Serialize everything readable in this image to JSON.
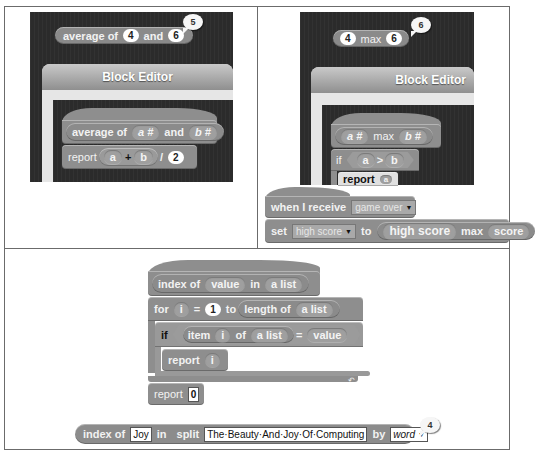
{
  "panels": {
    "top_left": {
      "result_block": {
        "label": "average of",
        "arg1": "4",
        "conj": "and",
        "arg2": "6",
        "result": "5"
      },
      "editor": {
        "title": "Block Editor",
        "prototype": {
          "label": "average of",
          "param1": "a #",
          "conj": "and",
          "param2": "b #"
        },
        "body": {
          "keyword": "report",
          "left": "a",
          "op": "+",
          "right": "b",
          "div": "/",
          "divisor": "2"
        }
      }
    },
    "top_right": {
      "result_block": {
        "arg1": "4",
        "op": "max",
        "arg2": "6",
        "result": "6"
      },
      "editor": {
        "title": "Block Editor",
        "prototype": {
          "param1": "a #",
          "op": "max",
          "param2": "b #"
        },
        "if_line": {
          "keyword": "if",
          "left": "a",
          "op": ">",
          "right": "b"
        },
        "report_line": {
          "keyword": "report",
          "arg": "a"
        }
      },
      "script": {
        "hat": {
          "label": "when I receive",
          "message": "game over"
        },
        "set": {
          "keyword": "set",
          "variable": "high score",
          "to": "to",
          "left": "high score",
          "op": "max",
          "right": "score"
        }
      }
    },
    "bottom": {
      "definition": {
        "prototype": {
          "label": "index of",
          "param1": "value",
          "in": "in",
          "param2": "a list"
        },
        "for": {
          "keyword": "for",
          "var": "i",
          "eq": "=",
          "start": "1",
          "to": "to",
          "length_label": "length of",
          "list": "a list"
        },
        "if": {
          "keyword": "if",
          "item_label": "item",
          "index": "i",
          "of": "of",
          "list": "a list",
          "eq": "=",
          "value": "value"
        },
        "inner_report": {
          "keyword": "report",
          "arg": "i"
        },
        "final_report": {
          "keyword": "report",
          "arg": "0"
        }
      },
      "call": {
        "label": "index of",
        "arg": "Joy",
        "in": "in",
        "split_label": "split",
        "text": "The·Beauty·And·Joy·Of·Computing",
        "by": "by",
        "mode": "word",
        "result": "4"
      }
    }
  }
}
